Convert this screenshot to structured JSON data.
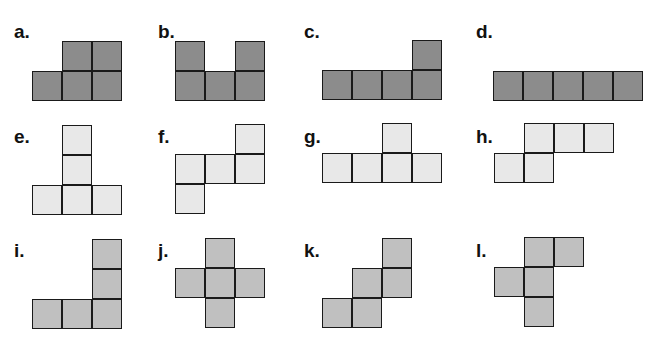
{
  "figure": {
    "cell_size": 30,
    "colors": {
      "dark": "#8c8c8c",
      "light": "#e8e8e8",
      "medium": "#c0c0c0"
    },
    "shapes": [
      {
        "label": "a.",
        "lx": 14,
        "ly": 22,
        "ox": 32,
        "oy": 41,
        "color": "dark",
        "cells": [
          [
            1,
            0
          ],
          [
            2,
            0
          ],
          [
            0,
            1
          ],
          [
            1,
            1
          ],
          [
            2,
            1
          ]
        ]
      },
      {
        "label": "b.",
        "lx": 158,
        "ly": 22,
        "ox": 175,
        "oy": 41,
        "color": "dark",
        "cells": [
          [
            0,
            0
          ],
          [
            2,
            0
          ],
          [
            0,
            1
          ],
          [
            1,
            1
          ],
          [
            2,
            1
          ]
        ]
      },
      {
        "label": "c.",
        "lx": 304,
        "ly": 22,
        "ox": 322,
        "oy": 40,
        "color": "dark",
        "cells": [
          [
            3,
            0
          ],
          [
            0,
            1
          ],
          [
            1,
            1
          ],
          [
            2,
            1
          ],
          [
            3,
            1
          ]
        ]
      },
      {
        "label": "d.",
        "lx": 476,
        "ly": 22,
        "ox": 493,
        "oy": 71,
        "color": "dark",
        "cells": [
          [
            0,
            0
          ],
          [
            1,
            0
          ],
          [
            2,
            0
          ],
          [
            3,
            0
          ],
          [
            4,
            0
          ]
        ]
      },
      {
        "label": "e.",
        "lx": 14,
        "ly": 127,
        "ox": 32,
        "oy": 125,
        "color": "light",
        "cells": [
          [
            1,
            0
          ],
          [
            1,
            1
          ],
          [
            0,
            2
          ],
          [
            1,
            2
          ],
          [
            2,
            2
          ]
        ]
      },
      {
        "label": "f.",
        "lx": 158,
        "ly": 127,
        "ox": 175,
        "oy": 124,
        "color": "light",
        "cells": [
          [
            2,
            0
          ],
          [
            0,
            1
          ],
          [
            1,
            1
          ],
          [
            2,
            1
          ],
          [
            0,
            2
          ]
        ]
      },
      {
        "label": "g.",
        "lx": 304,
        "ly": 127,
        "ox": 322,
        "oy": 123,
        "color": "light",
        "cells": [
          [
            2,
            0
          ],
          [
            0,
            1
          ],
          [
            1,
            1
          ],
          [
            2,
            1
          ],
          [
            3,
            1
          ]
        ]
      },
      {
        "label": "h.",
        "lx": 476,
        "ly": 127,
        "ox": 494,
        "oy": 123,
        "color": "light",
        "cells": [
          [
            1,
            0
          ],
          [
            2,
            0
          ],
          [
            3,
            0
          ],
          [
            0,
            1
          ],
          [
            1,
            1
          ]
        ]
      },
      {
        "label": "i.",
        "lx": 14,
        "ly": 241,
        "ox": 32,
        "oy": 239,
        "color": "medium",
        "cells": [
          [
            2,
            0
          ],
          [
            2,
            1
          ],
          [
            0,
            2
          ],
          [
            1,
            2
          ],
          [
            2,
            2
          ]
        ]
      },
      {
        "label": "j.",
        "lx": 158,
        "ly": 241,
        "ox": 175,
        "oy": 238,
        "color": "medium",
        "cells": [
          [
            1,
            0
          ],
          [
            0,
            1
          ],
          [
            1,
            1
          ],
          [
            2,
            1
          ],
          [
            1,
            2
          ]
        ]
      },
      {
        "label": "k.",
        "lx": 304,
        "ly": 241,
        "ox": 322,
        "oy": 238,
        "color": "medium",
        "cells": [
          [
            2,
            0
          ],
          [
            1,
            1
          ],
          [
            2,
            1
          ],
          [
            0,
            2
          ],
          [
            1,
            2
          ]
        ]
      },
      {
        "label": "l.",
        "lx": 476,
        "ly": 241,
        "ox": 494,
        "oy": 237,
        "color": "medium",
        "cells": [
          [
            1,
            0
          ],
          [
            2,
            0
          ],
          [
            0,
            1
          ],
          [
            1,
            1
          ],
          [
            1,
            2
          ]
        ]
      }
    ]
  }
}
